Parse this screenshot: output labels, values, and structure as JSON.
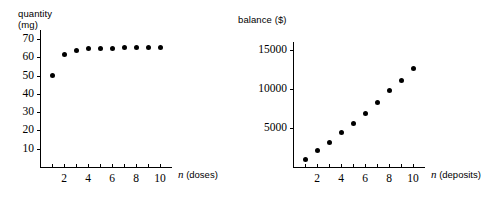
{
  "figure": {
    "background_color": "#ffffff",
    "ink_color": "#000000"
  },
  "panels": [
    {
      "id": "left",
      "y_axis_title": "quantity\n(mg)",
      "x_axis_label_var": "n",
      "x_axis_label_unit": "(doses)"
    },
    {
      "id": "right",
      "y_axis_title": "balance ($)",
      "x_axis_label_var": "n",
      "x_axis_label_unit": "(deposits)"
    }
  ],
  "chart_data": [
    {
      "type": "scatter",
      "title": "",
      "xlabel": "n (doses)",
      "ylabel": "quantity (mg)",
      "x": [
        1,
        2,
        3,
        4,
        5,
        6,
        7,
        8,
        9,
        10
      ],
      "values": [
        50,
        61.5,
        64,
        64.8,
        65,
        65.1,
        65.2,
        65.2,
        65.2,
        65.2
      ],
      "xlim": [
        0,
        11
      ],
      "ylim": [
        0,
        75
      ],
      "xticks": [
        1,
        2,
        3,
        4,
        5,
        6,
        7,
        8,
        9,
        10
      ],
      "xticklabels": [
        "",
        "2",
        "",
        "4",
        "",
        "6",
        "",
        "8",
        "",
        "10"
      ],
      "yticks": [
        10,
        20,
        30,
        40,
        50,
        60,
        70
      ],
      "yticklabels": [
        "10",
        "20",
        "30",
        "40",
        "50",
        "60",
        "70"
      ],
      "grid": false,
      "legend": "none",
      "marker": "filled-circle",
      "marker_color": "#000000"
    },
    {
      "type": "scatter",
      "title": "",
      "xlabel": "n (deposits)",
      "ylabel": "balance ($)",
      "x": [
        1,
        2,
        3,
        4,
        5,
        6,
        7,
        8,
        9,
        10
      ],
      "values": [
        1000,
        2100,
        3200,
        4400,
        5600,
        6900,
        8300,
        9800,
        11100,
        12600
      ],
      "xlim": [
        0,
        11
      ],
      "ylim": [
        0,
        16000
      ],
      "xticks": [
        1,
        2,
        3,
        4,
        5,
        6,
        7,
        8,
        9,
        10
      ],
      "xticklabels": [
        "",
        "2",
        "",
        "4",
        "",
        "6",
        "",
        "8",
        "",
        "10"
      ],
      "yticks": [
        5000,
        10000,
        15000
      ],
      "yticklabels": [
        "5000",
        "10000",
        "15000"
      ],
      "grid": false,
      "legend": "none",
      "marker": "filled-circle",
      "marker_color": "#000000"
    }
  ]
}
